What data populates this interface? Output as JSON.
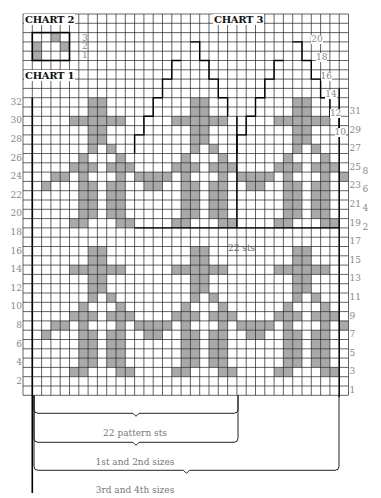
{
  "grid": {
    "left": 23,
    "top": 14,
    "cell": 9.3,
    "cols": 35,
    "rows": 41,
    "line_color": "#222",
    "fill_color": "#a9a9a9"
  },
  "titles": {
    "chart2": "CHART 2",
    "chart3": "CHART 3",
    "chart1": "CHART 1"
  },
  "chart2": {
    "row_labels": [
      "3",
      "2",
      "1"
    ],
    "rows": [
      "..#.",
      "#..#",
      "#..."
    ]
  },
  "chart1": {
    "left_row_labels": [
      "32",
      "30",
      "28",
      "26",
      "24",
      "22",
      "20",
      "18",
      "16",
      "14",
      "12",
      "10",
      "8",
      "6",
      "4",
      "2"
    ],
    "right_row_labels": [
      "31",
      "29",
      "27",
      "25",
      "23",
      "21",
      "19",
      "17",
      "15",
      "13",
      "11",
      "9",
      "7",
      "5",
      "3",
      "1"
    ],
    "right_size_labels": [
      "8",
      "6",
      "4",
      "2"
    ],
    "motif_rows_top_to_bottom": [
      "......##..........",
      "......##..........",
      "....######........",
      "......##..........",
      "......##..........",
      "......#.#.........",
      ".....#...#........",
      "....###.###.......",
      "..##.#...#.##.....",
      ".#...##.##...#....",
      ".....##.##........",
      ".....##.##........",
      ".....##.##........",
      "....##...##......."
    ]
  },
  "chart3": {
    "row_labels": [
      "20",
      "18",
      "16",
      "14",
      "12",
      "10"
    ]
  },
  "annotations": {
    "sts_label": "22 sts"
  },
  "brackets": [
    {
      "label": "22 pattern sts"
    },
    {
      "label": "1st and 2nd sizes"
    },
    {
      "label": "3rd and 4th sizes"
    }
  ]
}
